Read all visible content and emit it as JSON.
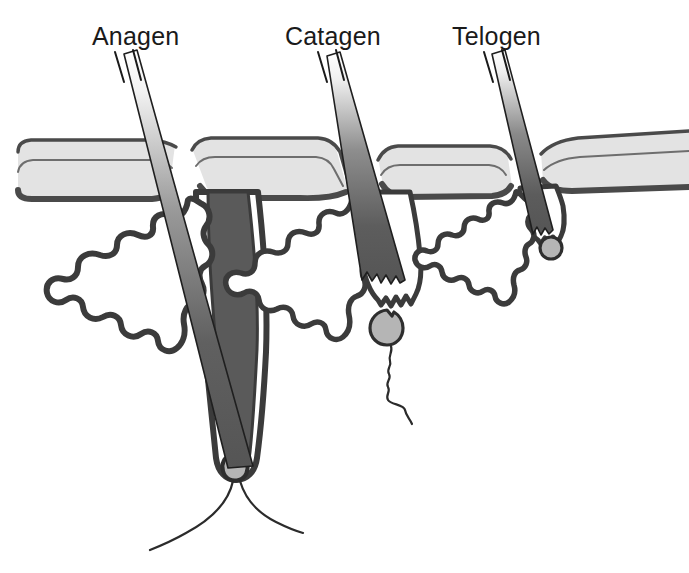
{
  "figure": {
    "background_color": "#ffffff",
    "width": 689,
    "height": 573
  },
  "palette": {
    "outline_dark": "#3b3b3b",
    "outline_black": "#1a1a1a",
    "epidermis_fill": "#e3e3e3",
    "epidermis_line": "#4a4a4a",
    "hair_shaft_dark": "#5a5a5a",
    "follicle_fill": "#5a5a5a",
    "papilla_fill": "#b5b5b5",
    "papilla_stroke": "#2e2e2e",
    "vessel_line": "#2b2b2b",
    "white": "#ffffff"
  },
  "stages": [
    {
      "id": "anagen",
      "label": "Anagen",
      "label_x": 92,
      "label_y": 45,
      "description": "Active growth phase: long deep follicle with attached dermal papilla and blood vessels",
      "has_sebaceous_gland": true,
      "has_blood_vessels": true,
      "papilla_attached": true,
      "club_hair": false
    },
    {
      "id": "catagen",
      "label": "Catagen",
      "label_x": 285,
      "label_y": 45,
      "description": "Regression phase: shortened follicle with jagged club hair base and detached papilla on a squiggly strand",
      "has_sebaceous_gland": true,
      "has_blood_vessels": false,
      "papilla_attached": false,
      "club_hair": true
    },
    {
      "id": "telogen",
      "label": "Telogen",
      "label_x": 452,
      "label_y": 45,
      "description": "Resting phase: very short follicle with club hair and small separated papilla",
      "has_sebaceous_gland": true,
      "has_blood_vessels": false,
      "papilla_attached": false,
      "club_hair": true
    }
  ],
  "structures": {
    "epidermis": "epidermis-band",
    "sebaceous_gland": "sebaceous-gland",
    "hair_shaft": "hair-shaft",
    "follicle": "hair-follicle",
    "dermal_papilla": "dermal-papilla",
    "blood_vessels": "blood-vessels",
    "leader_lines": "label-leader-lines"
  }
}
